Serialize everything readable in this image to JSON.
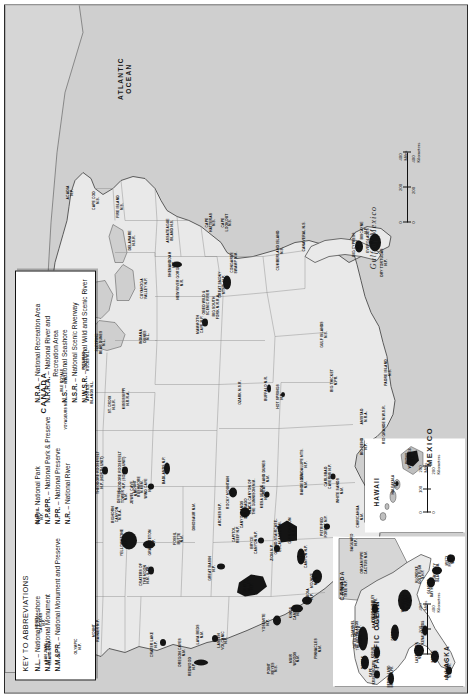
{
  "legend": {
    "heading": "KEY TO ABBREVIATIONS",
    "col1": [
      {
        "abbr": "N.L.",
        "text": " – National Lakeshore"
      },
      {
        "abbr": "N.M.",
        "text": " – National Monument"
      },
      {
        "abbr": "N.M.&PR.",
        "text": " – National Monument and Preserve"
      }
    ],
    "col2": [
      {
        "abbr": "N.P.",
        "text": " – National Park"
      },
      {
        "abbr": "N.P.&PR.",
        "text": " – National Park & Preserve"
      },
      {
        "abbr": "N.PR.",
        "text": " – National Preserve"
      },
      {
        "abbr": "N.R.",
        "text": " – National River"
      }
    ],
    "col3": [
      {
        "abbr": "N.R.A.",
        "text": " – National Recreation Area"
      },
      {
        "abbr": "N.R.R.A.",
        "text": " – National River and",
        "sub": "Recreation Area"
      },
      {
        "abbr": "N.S.",
        "text": " – National Seashore"
      },
      {
        "abbr": "N.S.R.",
        "text": " – National Scenic Riverway"
      },
      {
        "abbr": "N.W.S.R.",
        "text": " – National Wild and Scenic River"
      }
    ]
  },
  "countries": [
    {
      "name": "CANADA",
      "x": 300,
      "y": 38
    },
    {
      "name": "MEXICO",
      "x": 246,
      "y": 424
    }
  ],
  "oceans": [
    {
      "name": "ATLANTIC\nOCEAN",
      "x": 614,
      "y": 120
    },
    {
      "name": "PACIFIC\nOCEAN",
      "x": 58,
      "y": 372
    }
  ],
  "gulf": {
    "name": "Gulf  of  Mexico",
    "x": 455,
    "y": 368
  },
  "scales": {
    "main": {
      "miles": {
        "labels": [
          "0",
          "200",
          "400"
        ],
        "unit": "400 Miles"
      },
      "km": {
        "labels": [
          "0",
          "200",
          "400"
        ],
        "unit": "400 Kilometers"
      }
    },
    "alaska": {
      "miles": {
        "labels": [
          "0",
          "200",
          "400"
        ],
        "unit": "400 Miles"
      },
      "km": {
        "labels": [
          "0",
          "400"
        ],
        "unit": "400 Kilometers"
      }
    },
    "hawaii": {
      "miles": {
        "labels": [
          "0",
          "100",
          "200"
        ],
        "unit": "200 Miles"
      },
      "km": {
        "labels": [
          "0",
          "200"
        ],
        "unit": "200 Kilometers"
      }
    }
  },
  "insets": [
    {
      "name": "ALASKA",
      "label": "ALASKA"
    },
    {
      "name": "HAWAII",
      "label": "HAWAII"
    },
    {
      "name": "ALASKA-CANADA",
      "label": "CANADA"
    }
  ],
  "parks": [
    {
      "n": "OLYMPIC\nN.P.",
      "x": 46,
      "y": 74
    },
    {
      "n": "NORTH\nCASCADES\nN.P.",
      "x": 70,
      "y": 36
    },
    {
      "n": "MOUNT\nRAINIER N.P.",
      "x": 62,
      "y": 92
    },
    {
      "n": "SAN JUAN\nISLAND N.H.P.",
      "x": 40,
      "y": 44
    },
    {
      "n": "GLACIER\nN.P.",
      "x": 176,
      "y": 36
    },
    {
      "n": "CRATER LAKE\nN.P.",
      "x": 48,
      "y": 150
    },
    {
      "n": "OREGON CAVES\nN.M.",
      "x": 40,
      "y": 178
    },
    {
      "n": "LAVA BEDS\nN.M.",
      "x": 58,
      "y": 196
    },
    {
      "n": "REDWOOD\nN.P.",
      "x": 26,
      "y": 188
    },
    {
      "n": "LASSEN\nVOLCANIC\nN.P.",
      "x": 52,
      "y": 218
    },
    {
      "n": "POINT\nREYES\nN.S.",
      "x": 24,
      "y": 268
    },
    {
      "n": "MUIR\nWOODS\nN.M.",
      "x": 34,
      "y": 290
    },
    {
      "n": "PINNACLES\nN.M.",
      "x": 44,
      "y": 314
    },
    {
      "n": "YOSEMITE\nN.P.",
      "x": 70,
      "y": 262
    },
    {
      "n": "KINGS\nCANYON\nN.P.",
      "x": 80,
      "y": 290
    },
    {
      "n": "SEQUOIA\nN.P.",
      "x": 96,
      "y": 306
    },
    {
      "n": "DEATH\nVALLEY\nN.P.",
      "x": 106,
      "y": 244
    },
    {
      "n": "CHANNEL\nISLANDS\nN.P.",
      "x": 64,
      "y": 352
    },
    {
      "n": "SANTA MONICA\nMTNS. N.R.A.",
      "x": 78,
      "y": 372
    },
    {
      "n": "JOSHUA\nTREE N.P.",
      "x": 104,
      "y": 340
    },
    {
      "n": "MOJAVE\nN.PR.",
      "x": 112,
      "y": 310
    },
    {
      "n": "GREAT BASIN\nN.P.",
      "x": 124,
      "y": 208
    },
    {
      "n": "ZION N.P.",
      "x": 140,
      "y": 268
    },
    {
      "n": "BRYCE\nCANYON N.P.",
      "x": 150,
      "y": 250
    },
    {
      "n": "CAPITOL\nREEF N.P.",
      "x": 158,
      "y": 232
    },
    {
      "n": "GRAND\nCANYON N.P.",
      "x": 136,
      "y": 300
    },
    {
      "n": "GRAND STAIRCASE-\nESCALANTE N.M.",
      "x": 156,
      "y": 274
    },
    {
      "n": "GLEN CANYON\nN.R.A.",
      "x": 162,
      "y": 288
    },
    {
      "n": "ARCHES N.P.",
      "x": 178,
      "y": 216
    },
    {
      "n": "CANYONLANDS\nN.P.",
      "x": 178,
      "y": 240
    },
    {
      "n": "MESA VERDE\nN.P.",
      "x": 196,
      "y": 260
    },
    {
      "n": "PETRIFIED\nFOREST N.P.",
      "x": 166,
      "y": 320
    },
    {
      "n": "SAGUARO\nN.P.",
      "x": 150,
      "y": 350
    },
    {
      "n": "ORGAN PIPE\nCACTUS N.M.",
      "x": 130,
      "y": 360
    },
    {
      "n": "CHIRICAHUA\nN.M.",
      "x": 176,
      "y": 356
    },
    {
      "n": "WHITE SANDS\nN.M.",
      "x": 202,
      "y": 336
    },
    {
      "n": "CARLSBAD\nCAVERNS N.P.",
      "x": 216,
      "y": 324
    },
    {
      "n": "GUADALUPE MTS.\nN.P.",
      "x": 228,
      "y": 300
    },
    {
      "n": "BIG BEND\nN.P.",
      "x": 246,
      "y": 360
    },
    {
      "n": "RIO GRANDE N.W.S.R.",
      "x": 268,
      "y": 380
    },
    {
      "n": "AMISTAD\nN.R.A.",
      "x": 276,
      "y": 360
    },
    {
      "n": "PADRE ISLAND\nN.S.",
      "x": 320,
      "y": 384
    },
    {
      "n": "YELLOWSTONE\nN.P.",
      "x": 150,
      "y": 120
    },
    {
      "n": "GRAND TETON\nN.P.",
      "x": 150,
      "y": 148
    },
    {
      "n": "CRATERS OF\nTHE MOON\nN.M. & PR.",
      "x": 118,
      "y": 140
    },
    {
      "n": "DINOSAUR N.M.",
      "x": 176,
      "y": 190
    },
    {
      "n": "FOSSIL\nBUTTE\nN.M.",
      "x": 154,
      "y": 174
    },
    {
      "n": "BIGHORN\nCANYON\nN.R.A.",
      "x": 178,
      "y": 112
    },
    {
      "n": "DEVILS\nTOWER\nN.M.",
      "x": 196,
      "y": 118
    },
    {
      "n": "WIND CAVE\nN.P.",
      "x": 204,
      "y": 144
    },
    {
      "n": "JEWEL CAVE\nN.M.",
      "x": 200,
      "y": 130
    },
    {
      "n": "MOUNT\nRUSHMORE\nN.MEM.",
      "x": 206,
      "y": 134
    },
    {
      "n": "BADLANDS N.P.",
      "x": 222,
      "y": 160
    },
    {
      "n": "THEODORE ROOSEVELT\nN.P. (NORTH UNIT)",
      "x": 220,
      "y": 96
    },
    {
      "n": "THEODORE ROOSEVELT\nN.P. (SOUTH UNIT)",
      "x": 220,
      "y": 118
    },
    {
      "n": "ROCKY MOUNTAIN\nN.P.",
      "x": 200,
      "y": 226
    },
    {
      "n": "COLORADO\nN.M.",
      "x": 184,
      "y": 244
    },
    {
      "n": "BLACK CANYON OF\nTHE GUNNISON N.M.",
      "x": 196,
      "y": 248
    },
    {
      "n": "GREAT SAND DUNES\nN.M.",
      "x": 214,
      "y": 262
    },
    {
      "n": "BANDELIER\nN.M.",
      "x": 208,
      "y": 300
    },
    {
      "n": "VOYAGEURS N.P.",
      "x": 278,
      "y": 62
    },
    {
      "n": "ST. CROIX\nN.S.R.",
      "x": 288,
      "y": 108
    },
    {
      "n": "MISSISSIPPI\nN.R.R.A.",
      "x": 294,
      "y": 122
    },
    {
      "n": "APOSTLE\nISLANDS N.L.",
      "x": 300,
      "y": 86
    },
    {
      "n": "PICTURED\nROCKS N.L.",
      "x": 332,
      "y": 82
    },
    {
      "n": "ISLE ROYALE\nN.P.",
      "x": 312,
      "y": 60
    },
    {
      "n": "SLEEPING\nBEAR DUNES\nN.L.",
      "x": 350,
      "y": 96
    },
    {
      "n": "INDIANA\nDUNES\nN.L.",
      "x": 356,
      "y": 140
    },
    {
      "n": "CUYAHOGA\nVALLEY N.P.",
      "x": 404,
      "y": 140
    },
    {
      "n": "OZARK N.S.R.",
      "x": 300,
      "y": 236
    },
    {
      "n": "BUFFALO N.R.",
      "x": 304,
      "y": 262
    },
    {
      "n": "HOT SPRINGS\nN.P.",
      "x": 296,
      "y": 276
    },
    {
      "n": "MAMMOTH\nCAVE N.P.",
      "x": 368,
      "y": 196
    },
    {
      "n": "BIG SOUTH\nFORK N.R.R.A.",
      "x": 386,
      "y": 212
    },
    {
      "n": "GREAT SMOKY\nMTNS. N.P.",
      "x": 408,
      "y": 218
    },
    {
      "n": "OBED WILD &\nSCENIC RIVER",
      "x": 390,
      "y": 202
    },
    {
      "n": "CONGAREE\nSWAMP N.M.",
      "x": 430,
      "y": 230
    },
    {
      "n": "SHENANDOAH\nN.P.",
      "x": 428,
      "y": 168
    },
    {
      "n": "NEW RIVER GORGE\nN.R.",
      "x": 410,
      "y": 176
    },
    {
      "n": "DELAWARE\nN.S.R.",
      "x": 452,
      "y": 128
    },
    {
      "n": "ASSATEAGUE\nISLAND N.S.",
      "x": 462,
      "y": 166
    },
    {
      "n": "CAPE\nHATTERAS\nN.S.",
      "x": 470,
      "y": 206
    },
    {
      "n": "CAPE\nLOOKOUT\nN.S.",
      "x": 470,
      "y": 222
    },
    {
      "n": "CAPE COD\nN.S.",
      "x": 492,
      "y": 92
    },
    {
      "n": "FIRE ISLAND\nN.S.",
      "x": 486,
      "y": 116
    },
    {
      "n": "ACADIA\nN.P.",
      "x": 500,
      "y": 66
    },
    {
      "n": "CUMBERLAND ISLAND\nN.S.",
      "x": 442,
      "y": 276
    },
    {
      "n": "CANAVERAL N.S.",
      "x": 456,
      "y": 300
    },
    {
      "n": "BIG CYPRESS\nN.PR.",
      "x": 448,
      "y": 352
    },
    {
      "n": "EVERGLADES\nN.P.",
      "x": 452,
      "y": 366
    },
    {
      "n": "DRY TORTUGAS\nN.P.",
      "x": 430,
      "y": 380
    },
    {
      "n": "BISCAYNE\nN.P.",
      "x": 462,
      "y": 360
    },
    {
      "n": "GULF ISLANDS\nN.S.",
      "x": 358,
      "y": 320
    },
    {
      "n": "BIG THICKET\nN.PR.",
      "x": 312,
      "y": 330
    }
  ],
  "alaska_parks": [
    {
      "n": "GATES OF\nTHE ARCTIC\nN.P.&PR.",
      "x": 46,
      "y": 26
    },
    {
      "n": "NOATAK\nN.PR.",
      "x": 24,
      "y": 32
    },
    {
      "n": "KOBUK\nVALLEY\nN.P.",
      "x": 34,
      "y": 44
    },
    {
      "n": "CAPE\nKRUSENSTERN\nN.M.",
      "x": 14,
      "y": 42
    },
    {
      "n": "BERING LAND\nBRIDGE N.PR.",
      "x": 10,
      "y": 58
    },
    {
      "n": "YUKON-CHARLEY\nRIVERS N.PR.",
      "x": 78,
      "y": 42
    },
    {
      "n": "DENALI\nN.P.&PR.",
      "x": 52,
      "y": 62
    },
    {
      "n": "WRANGELL-\nST. ELIAS\nN.P.&PR.",
      "x": 84,
      "y": 74
    },
    {
      "n": "KENAI FJORDS\nN.P.",
      "x": 54,
      "y": 92
    },
    {
      "n": "LAKE CLARK\nN.P.&PR.",
      "x": 34,
      "y": 86
    },
    {
      "n": "KATMAI\nN.P.&PR.",
      "x": 30,
      "y": 102
    },
    {
      "n": "ANIAKCHAK\nN.M.&PR.",
      "x": 16,
      "y": 116
    },
    {
      "n": "GLACIER\nBAY N.P.&PR.",
      "x": 100,
      "y": 98
    },
    {
      "n": "KLONDIKE\nGOLD RUSH\nN.H.P.",
      "x": 112,
      "y": 88
    },
    {
      "n": "ADMIRALTY\nISLAND N.M.",
      "x": 114,
      "y": 104
    },
    {
      "n": "MISTY\nFIORDS\nN.M.",
      "x": 126,
      "y": 118
    }
  ],
  "hawaii_parks": [
    {
      "n": "HALEAKALA\nN.P.",
      "x": 48,
      "y": 30
    },
    {
      "n": "HAWAII\nVOLCANOES\nN.P.",
      "x": 74,
      "y": 46
    }
  ]
}
